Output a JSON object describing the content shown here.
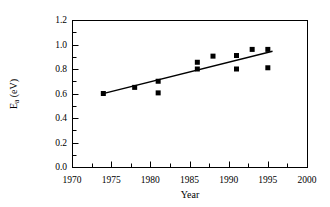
{
  "chart_data": {
    "type": "scatter",
    "title": "",
    "xlabel": "Year",
    "ylabel": "Ea (eV)",
    "ylabel_base": "E",
    "ylabel_sub": "a",
    "ylabel_unit": " (eV)",
    "xlim": [
      1970,
      2000
    ],
    "ylim": [
      0.0,
      1.2
    ],
    "xticks": [
      1970,
      1975,
      1980,
      1985,
      1990,
      1995,
      2000
    ],
    "xtick_labels": [
      "1970",
      "1975",
      "1980",
      "1985",
      "1990",
      "1995",
      "2000"
    ],
    "xtick_minor_step": 2.5,
    "yticks": [
      0.0,
      0.2,
      0.4,
      0.6,
      0.8,
      1.0,
      1.2
    ],
    "ytick_labels": [
      "0.0",
      "0.2",
      "0.4",
      "0.6",
      "0.8",
      "1.0",
      "1.2"
    ],
    "ytick_minor_step": 0.1,
    "grid": false,
    "legend": null,
    "marker": "filled-square",
    "marker_color": "#000000",
    "marker_size_px": 5,
    "points": [
      {
        "x": 1974.0,
        "y": 0.6
      },
      {
        "x": 1978.0,
        "y": 0.65
      },
      {
        "x": 1981.0,
        "y": 0.7
      },
      {
        "x": 1981.0,
        "y": 0.605
      },
      {
        "x": 1986.0,
        "y": 0.855
      },
      {
        "x": 1986.0,
        "y": 0.8
      },
      {
        "x": 1988.0,
        "y": 0.905
      },
      {
        "x": 1991.0,
        "y": 0.91
      },
      {
        "x": 1991.0,
        "y": 0.8
      },
      {
        "x": 1993.0,
        "y": 0.96
      },
      {
        "x": 1995.0,
        "y": 0.96
      },
      {
        "x": 1995.0,
        "y": 0.81
      }
    ],
    "trend_line": {
      "type": "linear-fit",
      "color": "#000000",
      "x_start": 1973.7,
      "y_start": 0.595,
      "x_end": 1995.6,
      "y_end": 0.945
    },
    "frame": {
      "color": "#000000",
      "line_width": 1
    }
  }
}
